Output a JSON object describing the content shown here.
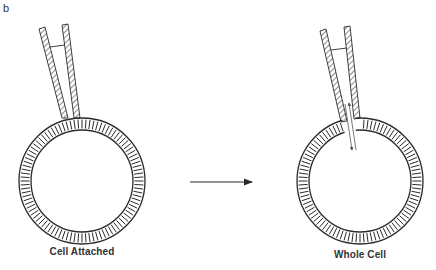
{
  "panel_label": "b",
  "colors": {
    "ink": "#2b2b2b",
    "background": "#ffffff"
  },
  "left_cell": {
    "caption": "Cell Attached",
    "center": [
      82,
      181
    ],
    "outer_radius": 63,
    "inner_radius": 51,
    "pipette": "sealed on membrane (cell-attached)"
  },
  "right_cell": {
    "caption": "Whole Cell",
    "center": [
      360,
      181
    ],
    "outer_radius": 63,
    "inner_radius": 51,
    "pipette": "membrane ruptured, bidirectional flow arrows into cell"
  },
  "transition_arrow": {
    "from": [
      190,
      182
    ],
    "to": [
      253,
      182
    ],
    "meaning": "transition from cell-attached to whole-cell"
  }
}
